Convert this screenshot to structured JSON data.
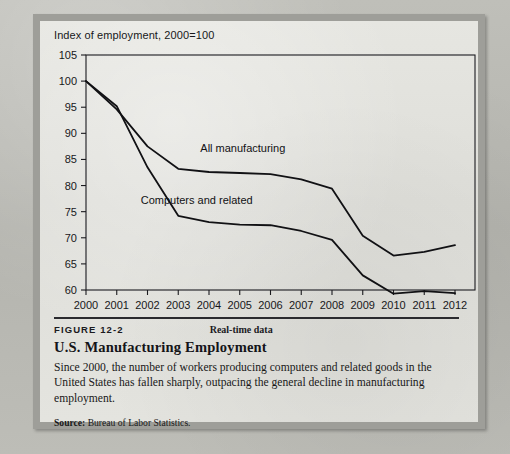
{
  "figure": {
    "number_label": "FIGURE 12-2",
    "realtime_label": "Real-time data",
    "title": "U.S. Manufacturing Employment",
    "description": "Since 2000, the number of workers producing computers and related goods in the United States has fallen sharply, outpacing the general decline in manufacturing employment.",
    "source_prefix": "Source:",
    "source_text": "Bureau of Labor Statistics."
  },
  "chart_data": {
    "type": "line",
    "title": "",
    "axis_note": "Index of employment, 2000=100",
    "xlabel": "",
    "ylabel": "Index of employment, 2000=100",
    "x": [
      2000,
      2001,
      2002,
      2003,
      2004,
      2005,
      2006,
      2007,
      2008,
      2009,
      2010,
      2011,
      2012
    ],
    "xtick_labels": [
      "2000",
      "2001",
      "2002",
      "2003",
      "2004",
      "2005",
      "2006",
      "2007",
      "2008",
      "2009",
      "2010",
      "2011",
      "2012"
    ],
    "ytick_labels": [
      "60",
      "65",
      "70",
      "75",
      "80",
      "85",
      "90",
      "95",
      "100",
      "105"
    ],
    "yticks": [
      60,
      65,
      70,
      75,
      80,
      85,
      90,
      95,
      100,
      105
    ],
    "ylim": [
      60,
      105
    ],
    "xlim": [
      2000,
      2012
    ],
    "grid": false,
    "legend_position": "inline-annotation",
    "series": [
      {
        "name": "All manufacturing",
        "label": "All manufacturing",
        "color": "#111114",
        "values": [
          100,
          94.6,
          87.5,
          83.2,
          82.6,
          82.4,
          82.2,
          81.2,
          79.4,
          70.4,
          66.6,
          67.3,
          68.6
        ]
      },
      {
        "name": "Computers and related",
        "label": "Computers and related",
        "color": "#111114",
        "values": [
          100,
          95.2,
          83.5,
          74.2,
          73.0,
          72.5,
          72.4,
          71.3,
          69.6,
          62.8,
          59.3,
          59.8,
          59.4
        ]
      }
    ],
    "annotations": [
      {
        "text": "All manufacturing",
        "x": 2005.1,
        "y": 86.4
      },
      {
        "text": "Computers and related",
        "x": 2003.6,
        "y": 76.4
      }
    ]
  }
}
